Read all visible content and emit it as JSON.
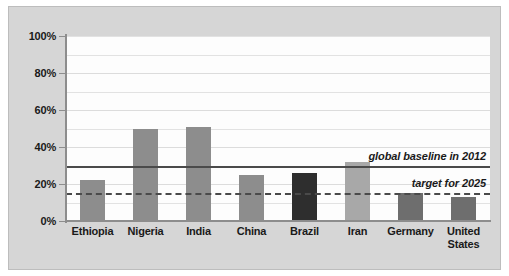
{
  "chart_data": {
    "type": "bar",
    "title": "",
    "subtitle": "",
    "xlabel": "",
    "ylabel": "",
    "ylim": [
      0,
      100
    ],
    "grid": true,
    "legend_position": "none",
    "categories": [
      "Ethiopia",
      "Nigeria",
      "India",
      "China",
      "Brazil",
      "Iran",
      "Germany",
      "United States"
    ],
    "values": [
      22,
      50,
      51,
      25,
      26,
      32,
      15,
      13
    ],
    "value_suffix": "%",
    "bar_colors": [
      "#8d8d8d",
      "#8d8d8d",
      "#8d8d8d",
      "#8d8d8d",
      "#2e2e2e",
      "#a8a8a8",
      "#6e6e6e",
      "#6e6e6e"
    ],
    "ytick_labels": [
      "100%",
      "80%",
      "60%",
      "40%",
      "20%",
      "0%"
    ],
    "ytick_values": [
      100,
      80,
      60,
      40,
      20,
      0
    ],
    "annotations": [
      {
        "name": "global-baseline",
        "label": "global baseline in 2012",
        "value": 30,
        "style": "solid"
      },
      {
        "name": "target-2025",
        "label": "target for 2025",
        "value": 15,
        "style": "dashed"
      }
    ]
  },
  "chart": {
    "axis_color": "#8d8d8d",
    "grid_color": "#e2e2e2",
    "plot_background": "#fdfdfd",
    "panel_background": "#d6d6d6",
    "reference_line_color": "#4a4a4a"
  }
}
